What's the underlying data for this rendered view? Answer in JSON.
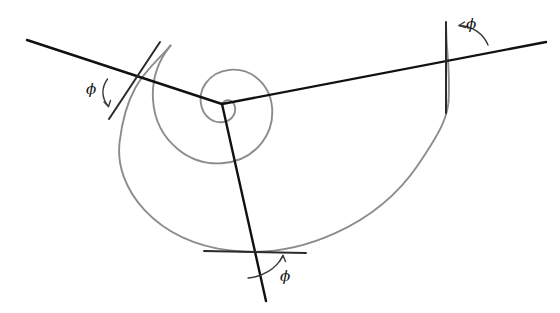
{
  "figure": {
    "background_color": "#ffffff",
    "spiral_color": "#8c8c8c",
    "ray_color": "#111111",
    "tangent_color": "#2b2b2b",
    "arc_color": "#3a3a3a",
    "canvas": {
      "width": 560,
      "height": 313
    },
    "pole": {
      "x": 222,
      "y": 104,
      "label": "spiral pole"
    }
  },
  "chart_data": {
    "type": "line",
    "xlabel": "",
    "ylabel": "",
    "xlim": [
      0,
      560
    ],
    "ylim": [
      0,
      313
    ],
    "grid": false,
    "legend": "none",
    "curves": [
      {
        "name": "logarithmic-spiral",
        "color": "#8c8c8c",
        "stroke_width": 1.9,
        "path": "M 222.8 103.2 C 224.4 100.6 227.6 99.4 230.3 100.7 C 235.6 103.2 236.4 110.4 233.6 115.2 C 229.0 123.2 217.5 124.2 210.3 119.2 C 198.8 111.2 197.9 94.3 205.6 83.4 C 217.2 67.0 241.0 65.9 255.6 77.0 C 276.1 92.6 277.0 123.0 262.1 142.4 C 241.9 168.6 203.0 169.4 178.2 149.4 C 146.3 123.7 145.4 76.1 170.5 45.6"
      },
      {
        "name": "spiral-outer-sweep",
        "color": "#8c8c8c",
        "stroke_width": 1.9,
        "path": "M 170.5 45.6 C 151.4 68.6 127.0 80.4 119.6 142.0 C 114.0 188.4 155.0 241.0 230.0 250.5 C 300.0 259.4 378.0 224.0 418.0 165.0 C 441.0 131.0 447.0 118.0 448.6 101.0"
      },
      {
        "name": "spiral-tail-above-right-crossing",
        "color": "#8c8c8c",
        "stroke_width": 1.9,
        "path": "M 448.6 101.0 C 449.2 88.0 448.9 70.0 447.4 52.0 C 446.6 43.0 446.2 33.0 446.0 24.0"
      }
    ],
    "rays": [
      {
        "name": "ray-upper-left",
        "color": "#111111",
        "stroke_width": 2.4,
        "from": {
          "x": 222,
          "y": 104
        },
        "to": {
          "x": 27,
          "y": 40
        },
        "crossing": {
          "x": 133,
          "y": 88,
          "label": "left tangency crossing"
        }
      },
      {
        "name": "ray-upper-right",
        "color": "#111111",
        "stroke_width": 2.4,
        "from": {
          "x": 222,
          "y": 104
        },
        "to": {
          "x": 546,
          "y": 42
        },
        "crossing": {
          "x": 448,
          "y": 63,
          "label": "right tangency crossing"
        }
      },
      {
        "name": "ray-lower",
        "color": "#111111",
        "stroke_width": 2.4,
        "from": {
          "x": 222,
          "y": 104
        },
        "to": {
          "x": 266,
          "y": 301
        },
        "crossing": {
          "x": 257,
          "y": 253,
          "label": "bottom tangency crossing"
        }
      }
    ],
    "tangents": [
      {
        "name": "tangent-left",
        "color": "#2b2b2b",
        "stroke_width": 2.0,
        "from": {
          "x": 160,
          "y": 42
        },
        "to": {
          "x": 109,
          "y": 119
        }
      },
      {
        "name": "tangent-right",
        "color": "#2b2b2b",
        "stroke_width": 2.0,
        "from": {
          "x": 446,
          "y": 22
        },
        "to": {
          "x": 446,
          "y": 113
        }
      },
      {
        "name": "tangent-bottom",
        "color": "#2b2b2b",
        "stroke_width": 2.0,
        "from": {
          "x": 204,
          "y": 251
        },
        "to": {
          "x": 306,
          "y": 253
        }
      }
    ],
    "angle_marks": [
      {
        "name": "angle-arc-left",
        "label": "ϕ",
        "color": "#3a3a3a",
        "stroke_width": 1.4,
        "arc_path": "M 107.5 79.0 C 101.0 88.0 101.5 98.5 108.5 106.5",
        "arrow_path": "M 108.5 106.5 L 104.0 102.0 M 108.5 106.5 L 110.5 100.5",
        "label_position": {
          "x": 86,
          "y": 82
        }
      },
      {
        "name": "angle-arc-right",
        "label": "ϕ",
        "color": "#3a3a3a",
        "stroke_width": 1.4,
        "arc_path": "M 488.0 45.0 C 483.5 34.0 473.0 26.0 459.0 25.5",
        "arrow_path": "M 459.0 25.5 L 465.5 27.5 M 459.0 25.5 L 464.5 22.0",
        "label_position": {
          "x": 466,
          "y": 17
        }
      },
      {
        "name": "angle-arc-bottom",
        "label": "ϕ",
        "color": "#3a3a3a",
        "stroke_width": 1.4,
        "arc_path": "M 248.0 278.0 C 262.0 277.0 276.5 269.0 283.0 255.5",
        "arrow_path": "M 283.0 255.5 L 279.5 261.5 M 283.0 255.5 L 285.5 261.5",
        "label_position": {
          "x": 280,
          "y": 269
        }
      }
    ],
    "annotations": [
      {
        "text": "ϕ",
        "role": "tangent-angle-left"
      },
      {
        "text": "ϕ",
        "role": "tangent-angle-right"
      },
      {
        "text": "ϕ",
        "role": "tangent-angle-bottom"
      }
    ]
  }
}
